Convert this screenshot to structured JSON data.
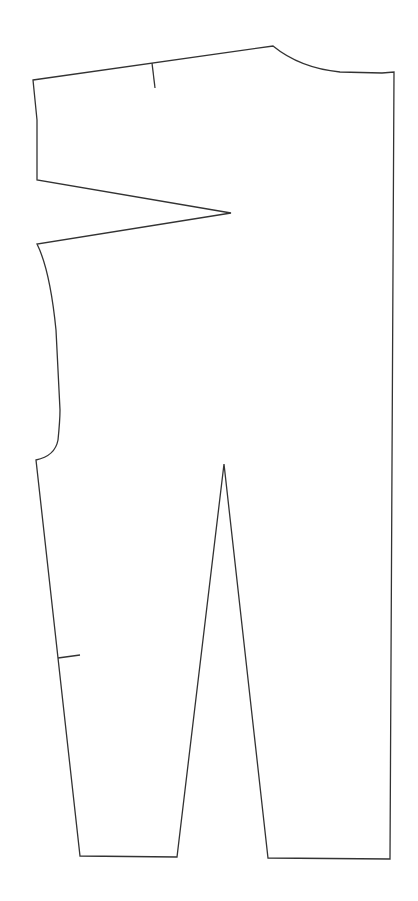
{
  "diagram": {
    "type": "sewing-pattern-piece",
    "stroke_color": "#333333",
    "background": "#ffffff",
    "stroke_width": 1.3,
    "outline_path": "M33,80 L273,46 Q300,68 340,72 L382,73 L394,72 L390,859 L268,858 L224,464 L177,857 L80,856 L36,460 Q55,456 58,440 Q60,420 60,410 L56,330 Q50,270 37,244 L231,213 L37,180 L37,120 L35,100 L33,80 Z",
    "notches": [
      {
        "name": "waist-notch",
        "x1": 152,
        "y1": 63,
        "x2": 155,
        "y2": 88
      },
      {
        "name": "side-notch",
        "x1": 58,
        "y1": 658,
        "x2": 80,
        "y2": 655
      }
    ]
  }
}
